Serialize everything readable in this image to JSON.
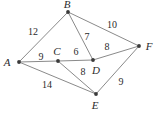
{
  "figure": {
    "type": "weighted-undirected-graph",
    "width": 162,
    "height": 114,
    "background_color": "#ffffff",
    "edge_color": "#8a8a8a",
    "node_color": "#3a3a3a",
    "label_color": "#2b2b2b"
  },
  "chart_data": {
    "type": "diagram",
    "title": "",
    "nodes": [
      {
        "id": "A",
        "label": "A",
        "x": 19,
        "y": 62,
        "label_x": 7,
        "label_y": 62
      },
      {
        "id": "B",
        "label": "B",
        "x": 68,
        "y": 12,
        "label_x": 67,
        "label_y": 4
      },
      {
        "id": "C",
        "label": "C",
        "x": 58,
        "y": 61,
        "label_x": 57,
        "label_y": 51
      },
      {
        "id": "D",
        "label": "D",
        "x": 93,
        "y": 60,
        "label_x": 96,
        "label_y": 70
      },
      {
        "id": "E",
        "label": "E",
        "x": 96,
        "y": 94,
        "label_x": 95,
        "label_y": 105
      },
      {
        "id": "F",
        "label": "F",
        "x": 139,
        "y": 46,
        "label_x": 149,
        "label_y": 46
      }
    ],
    "edges": [
      {
        "from": "A",
        "to": "B",
        "weight": 12,
        "label": "12",
        "label_x": 33,
        "label_y": 32
      },
      {
        "from": "A",
        "to": "C",
        "weight": 9,
        "label": "9",
        "label_x": 41,
        "label_y": 57
      },
      {
        "from": "A",
        "to": "E",
        "weight": 14,
        "label": "14",
        "label_x": 47,
        "label_y": 85
      },
      {
        "from": "B",
        "to": "D",
        "weight": 7,
        "label": "7",
        "label_x": 87,
        "label_y": 37
      },
      {
        "from": "B",
        "to": "F",
        "weight": 10,
        "label": "10",
        "label_x": 112,
        "label_y": 25
      },
      {
        "from": "C",
        "to": "D",
        "weight": 6,
        "label": "6",
        "label_x": 76,
        "label_y": 52
      },
      {
        "from": "C",
        "to": "E",
        "weight": 8,
        "label": "8",
        "label_x": 83,
        "label_y": 72
      },
      {
        "from": "D",
        "to": "F",
        "weight": 8,
        "label": "8",
        "label_x": 107,
        "label_y": 47
      },
      {
        "from": "E",
        "to": "F",
        "weight": 9,
        "label": "9",
        "label_x": 121,
        "label_y": 82
      }
    ]
  }
}
